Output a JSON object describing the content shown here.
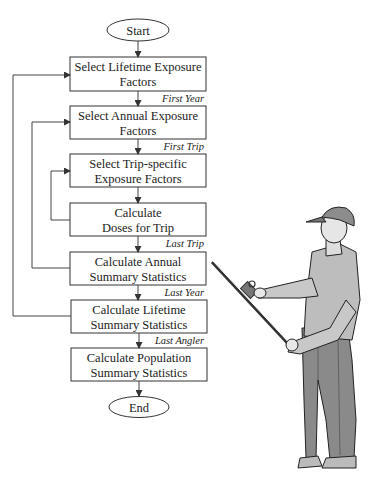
{
  "diagram": {
    "type": "flowchart",
    "terminals": {
      "start": "Start",
      "end": "End"
    },
    "steps": [
      {
        "id": "s1",
        "lines": [
          "Select Lifetime Exposure",
          "Factors"
        ]
      },
      {
        "id": "s2",
        "lines": [
          "Select Annual Exposure",
          "Factors"
        ]
      },
      {
        "id": "s3",
        "lines": [
          "Select Trip-specific",
          "Exposure Factors"
        ]
      },
      {
        "id": "s4",
        "lines": [
          "Calculate",
          "Doses for Trip"
        ]
      },
      {
        "id": "s5",
        "lines": [
          "Calculate Annual",
          "Summary Statistics"
        ]
      },
      {
        "id": "s6",
        "lines": [
          "Calculate Lifetime",
          "Summary Statistics"
        ]
      },
      {
        "id": "s7",
        "lines": [
          "Calculate Population",
          "Summary Statistics"
        ]
      }
    ],
    "edge_conditions": {
      "s1_to_s2": "First Year",
      "s2_to_s3": "First Trip",
      "s4_to_s5": "Last Trip",
      "s5_to_s6": "Last Year",
      "s6_to_s7": "Last Angler"
    },
    "loops": [
      {
        "from": "s4",
        "to": "s3",
        "name": "trip-loop"
      },
      {
        "from": "s5",
        "to": "s2",
        "name": "year-loop"
      },
      {
        "from": "s6",
        "to": "s1",
        "name": "angler-loop"
      }
    ]
  },
  "illustration": {
    "subject": "angler-holding-fishing-rod"
  }
}
